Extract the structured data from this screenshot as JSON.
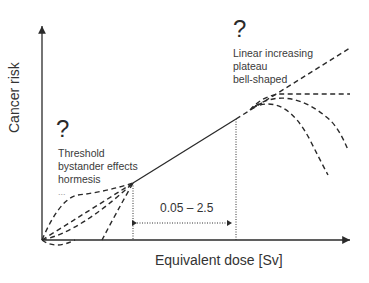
{
  "axes": {
    "x_label": "Equivalent dose [Sv]",
    "y_label": "Cancer risk"
  },
  "low_dose_annotation": {
    "question_mark": "?",
    "lines": [
      "Threshold",
      "bystander effects",
      "hormesis"
    ],
    "ellipsis": "..."
  },
  "high_dose_annotation": {
    "question_mark": "?",
    "lines": [
      "Linear increasing",
      "plateau",
      "bell-shaped"
    ]
  },
  "range_label": "0.05 – 2.5",
  "colors": {
    "line": "#2a2a2a",
    "text": "#333333",
    "background": "#ffffff"
  }
}
